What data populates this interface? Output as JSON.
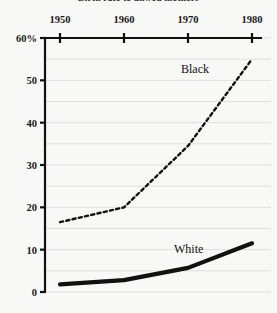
{
  "chart_data": {
    "type": "line",
    "title": "Birth rate to unwed mothers",
    "xlabel": "",
    "ylabel": "",
    "x": [
      1950,
      1960,
      1970,
      1980
    ],
    "xticks": [
      "1950",
      "1960",
      "1970",
      "1980"
    ],
    "yticks": [
      "60%",
      "50",
      "40",
      "30",
      "20",
      "10",
      "0"
    ],
    "ytick_values": [
      60,
      50,
      40,
      30,
      20,
      10,
      0
    ],
    "ylim": [
      0,
      60
    ],
    "xlim": [
      1950,
      1980
    ],
    "grid": true,
    "grid_interval": 5,
    "axis_position": "x-axis-top",
    "legend": "inline-labels",
    "series": [
      {
        "name": "Black",
        "style": "dashed",
        "color": "#111111",
        "label_text": "Black",
        "values": [
          16.5,
          20.0,
          34.5,
          55.0
        ]
      },
      {
        "name": "White",
        "style": "solid-thick",
        "color": "#111111",
        "label_text": "White",
        "values": [
          1.8,
          2.8,
          5.7,
          11.5
        ]
      }
    ]
  },
  "colors": {
    "background": "#f8f8f6",
    "axis": "#111111",
    "grid": "#d8d8d4",
    "text": "#1a1a1a"
  }
}
